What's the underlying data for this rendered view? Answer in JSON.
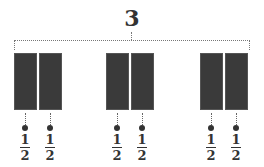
{
  "total": "3",
  "groups": [
    {
      "parts": [
        {
          "num": "1",
          "den": "2"
        },
        {
          "num": "1",
          "den": "2"
        }
      ]
    },
    {
      "parts": [
        {
          "num": "1",
          "den": "2"
        },
        {
          "num": "1",
          "den": "2"
        }
      ]
    },
    {
      "parts": [
        {
          "num": "1",
          "den": "2"
        },
        {
          "num": "1",
          "den": "2"
        }
      ]
    }
  ],
  "colors": {
    "block": "#3a3a3a",
    "text": "#333333"
  }
}
